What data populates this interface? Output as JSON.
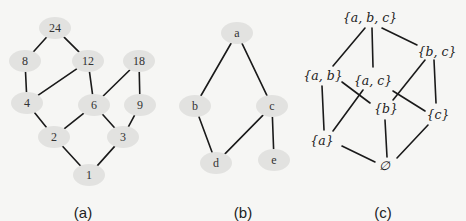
{
  "figure": {
    "panels": [
      {
        "id": "a",
        "caption": "(a)",
        "caption_pos": [
          83,
          213
        ],
        "node_style": "ellipse",
        "nodes": [
          {
            "id": "24",
            "label": "24",
            "x": 55,
            "y": 28
          },
          {
            "id": "8",
            "label": "8",
            "x": 25,
            "y": 61
          },
          {
            "id": "12",
            "label": "12",
            "x": 88,
            "y": 61
          },
          {
            "id": "18",
            "label": "18",
            "x": 139,
            "y": 61
          },
          {
            "id": "4",
            "label": "4",
            "x": 27,
            "y": 103
          },
          {
            "id": "6",
            "label": "6",
            "x": 94,
            "y": 105
          },
          {
            "id": "9",
            "label": "9",
            "x": 140,
            "y": 105
          },
          {
            "id": "2",
            "label": "2",
            "x": 54,
            "y": 137
          },
          {
            "id": "3",
            "label": "3",
            "x": 123,
            "y": 137
          },
          {
            "id": "1",
            "label": "1",
            "x": 89,
            "y": 175
          }
        ],
        "edges": [
          [
            "24",
            "8"
          ],
          [
            "24",
            "12"
          ],
          [
            "8",
            "4"
          ],
          [
            "12",
            "4"
          ],
          [
            "12",
            "6"
          ],
          [
            "18",
            "6"
          ],
          [
            "18",
            "9"
          ],
          [
            "4",
            "2"
          ],
          [
            "6",
            "2"
          ],
          [
            "6",
            "3"
          ],
          [
            "9",
            "3"
          ],
          [
            "2",
            "1"
          ],
          [
            "3",
            "1"
          ]
        ]
      },
      {
        "id": "b",
        "caption": "(b)",
        "caption_pos": [
          243,
          213
        ],
        "node_style": "ellipse",
        "nodes": [
          {
            "id": "a",
            "label": "a",
            "x": 237,
            "y": 33
          },
          {
            "id": "b",
            "label": "b",
            "x": 195,
            "y": 106
          },
          {
            "id": "c",
            "label": "c",
            "x": 272,
            "y": 106
          },
          {
            "id": "d",
            "label": "d",
            "x": 216,
            "y": 163
          },
          {
            "id": "e",
            "label": "e",
            "x": 274,
            "y": 160
          }
        ],
        "edges": [
          [
            "a",
            "b"
          ],
          [
            "a",
            "c"
          ],
          [
            "b",
            "d"
          ],
          [
            "c",
            "d"
          ],
          [
            "c",
            "e"
          ]
        ]
      },
      {
        "id": "c",
        "caption": "(c)",
        "caption_pos": [
          383,
          213
        ],
        "node_style": "text",
        "nodes": [
          {
            "id": "abc",
            "label": "{a, b, c}",
            "x": 370,
            "y": 18
          },
          {
            "id": "bc",
            "label": "{b, c}",
            "x": 437,
            "y": 52
          },
          {
            "id": "ab",
            "label": "{a, b}",
            "x": 323,
            "y": 76
          },
          {
            "id": "ac",
            "label": "{a, c}",
            "x": 373,
            "y": 81
          },
          {
            "id": "b",
            "label": "{b}",
            "x": 386,
            "y": 109
          },
          {
            "id": "c",
            "label": "{c}",
            "x": 438,
            "y": 115
          },
          {
            "id": "a",
            "label": "{a}",
            "x": 322,
            "y": 141
          },
          {
            "id": "empty",
            "label": "∅",
            "x": 384,
            "y": 166
          }
        ],
        "edge_segments": [
          {
            "from": "abc",
            "to": "ab",
            "x1": 365,
            "y1": 28,
            "x2": 333,
            "y2": 66
          },
          {
            "from": "abc",
            "to": "ac",
            "x1": 372,
            "y1": 28,
            "x2": 373,
            "y2": 67
          },
          {
            "from": "abc",
            "to": "bc",
            "x1": 382,
            "y1": 28,
            "x2": 417,
            "y2": 45
          },
          {
            "from": "ab",
            "to": "a",
            "x1": 322,
            "y1": 86,
            "x2": 324,
            "y2": 130
          },
          {
            "from": "ab",
            "to": "b",
            "x1": 342,
            "y1": 82,
            "x2": 370,
            "y2": 103
          },
          {
            "from": "ac",
            "to": "a",
            "x1": 363,
            "y1": 90,
            "x2": 333,
            "y2": 131
          },
          {
            "from": "ac",
            "to": "c",
            "x1": 393,
            "y1": 91,
            "x2": 425,
            "y2": 111
          },
          {
            "from": "bc",
            "to": "b",
            "x1": 425,
            "y1": 60,
            "x2": 393,
            "y2": 100
          },
          {
            "from": "bc",
            "to": "c",
            "x1": 434,
            "y1": 60,
            "x2": 436,
            "y2": 103
          },
          {
            "from": "a",
            "to": "empty",
            "x1": 342,
            "y1": 146,
            "x2": 375,
            "y2": 162
          },
          {
            "from": "b",
            "to": "empty",
            "x1": 385,
            "y1": 120,
            "x2": 387,
            "y2": 157
          },
          {
            "from": "c",
            "to": "empty",
            "x1": 428,
            "y1": 125,
            "x2": 397,
            "y2": 158
          }
        ]
      }
    ],
    "colors": {
      "background": "#f6f6f4",
      "node_fill": "#e2e2e0",
      "edge": "#1a1a1a",
      "text": "#222222"
    }
  }
}
